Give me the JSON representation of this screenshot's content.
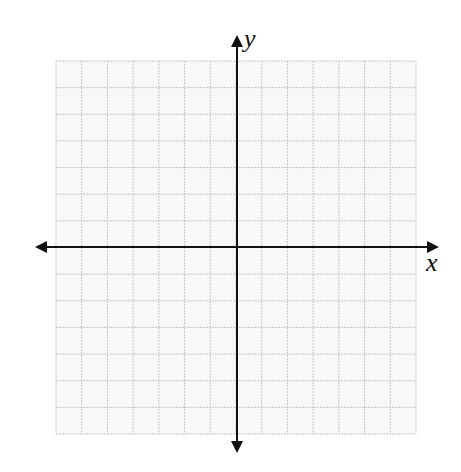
{
  "diagram": {
    "type": "coordinate-plane",
    "x_axis_label": "x",
    "y_axis_label": "y",
    "grid": {
      "columns": 14,
      "rows": 14,
      "cells_left_of_y_axis": 7,
      "cells_right_of_y_axis": 7,
      "cells_above_x_axis": 7,
      "cells_below_x_axis": 7,
      "left": 56,
      "top": 61,
      "right": 416,
      "bottom": 434,
      "line_color": "#c4c4c4",
      "fill_color": "#f8f8f8"
    },
    "axes": {
      "color": "#111111",
      "origin": [
        237,
        247
      ],
      "x_arrow_left": 35,
      "x_arrow_right": 439,
      "y_arrow_top": 35,
      "y_arrow_bottom": 453
    }
  }
}
